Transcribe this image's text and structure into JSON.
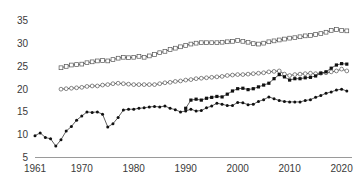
{
  "chart_data": {
    "type": "line",
    "title": "",
    "subtitle": "",
    "xlabel": "",
    "ylabel": "",
    "xlim": [
      1961,
      2022
    ],
    "ylim": [
      5,
      36.5
    ],
    "grid": false,
    "legend": "none",
    "x_ticks": [
      1961,
      1970,
      1980,
      1990,
      2000,
      2010,
      2020
    ],
    "x_tick_labels": [
      "1961",
      "1970",
      "1980",
      "1990",
      "2000",
      "2010",
      "2020"
    ],
    "y_ticks": [
      5,
      10,
      15,
      20,
      25,
      30,
      35
    ],
    "y_tick_labels": [
      "5",
      "10",
      "15",
      "20",
      "25",
      "30",
      "35"
    ],
    "series": [
      {
        "name": "series-open-squares",
        "marker": "open-square",
        "x": [
          1966,
          1967,
          1968,
          1969,
          1970,
          1971,
          1972,
          1973,
          1974,
          1975,
          1976,
          1977,
          1978,
          1979,
          1980,
          1981,
          1982,
          1983,
          1984,
          1985,
          1986,
          1987,
          1988,
          1989,
          1990,
          1991,
          1992,
          1993,
          1994,
          1995,
          1996,
          1997,
          1998,
          1999,
          2000,
          2001,
          2002,
          2003,
          2004,
          2005,
          2006,
          2007,
          2008,
          2009,
          2010,
          2011,
          2012,
          2013,
          2014,
          2015,
          2016,
          2017,
          2018,
          2019,
          2020,
          2021
        ],
        "values": [
          24.7,
          25.0,
          25.3,
          25.4,
          25.5,
          25.8,
          26.0,
          26.2,
          26.3,
          26.2,
          26.5,
          26.8,
          27.0,
          26.9,
          27.0,
          27.2,
          27.0,
          27.3,
          27.6,
          28.0,
          28.3,
          28.7,
          29.0,
          29.3,
          29.6,
          29.9,
          30.1,
          30.2,
          30.2,
          30.2,
          30.2,
          30.3,
          30.4,
          30.5,
          30.7,
          30.5,
          30.3,
          30.0,
          29.9,
          30.1,
          30.4,
          30.6,
          30.8,
          31.0,
          31.2,
          31.3,
          31.5,
          31.7,
          31.8,
          32.0,
          32.2,
          32.5,
          32.9,
          33.1,
          32.9,
          32.8
        ]
      },
      {
        "name": "series-open-circles",
        "marker": "open-circle",
        "x": [
          1966,
          1967,
          1968,
          1969,
          1970,
          1971,
          1972,
          1973,
          1974,
          1975,
          1976,
          1977,
          1978,
          1979,
          1980,
          1981,
          1982,
          1983,
          1984,
          1985,
          1986,
          1987,
          1988,
          1989,
          1990,
          1991,
          1992,
          1993,
          1994,
          1995,
          1996,
          1997,
          1998,
          1999,
          2000,
          2001,
          2002,
          2003,
          2004,
          2005,
          2006,
          2007,
          2008,
          2009,
          2010,
          2011,
          2012,
          2013,
          2014,
          2015,
          2016,
          2017,
          2018,
          2019,
          2020,
          2021
        ],
        "values": [
          20.0,
          20.1,
          20.2,
          20.3,
          20.4,
          20.6,
          20.7,
          20.7,
          20.9,
          21.0,
          21.2,
          21.3,
          21.2,
          21.1,
          21.0,
          21.0,
          21.0,
          21.0,
          21.0,
          21.2,
          21.4,
          21.5,
          21.7,
          21.8,
          22.0,
          22.1,
          22.3,
          22.4,
          22.5,
          22.6,
          22.7,
          22.8,
          23.0,
          23.1,
          23.2,
          23.2,
          23.3,
          23.4,
          23.5,
          23.6,
          23.8,
          23.9,
          24.0,
          23.3,
          23.0,
          23.2,
          23.3,
          23.4,
          23.5,
          23.4,
          23.5,
          23.6,
          23.8,
          24.0,
          24.4,
          24.0
        ]
      },
      {
        "name": "series-filled-squares",
        "marker": "filled-square",
        "x": [
          1990,
          1991,
          1992,
          1993,
          1994,
          1995,
          1996,
          1997,
          1998,
          1999,
          2000,
          2001,
          2002,
          2003,
          2004,
          2005,
          2006,
          2007,
          2008,
          2009,
          2010,
          2011,
          2012,
          2013,
          2014,
          2015,
          2016,
          2017,
          2018,
          2019,
          2020,
          2021
        ],
        "values": [
          15.8,
          17.6,
          17.8,
          17.6,
          18.0,
          18.2,
          18.4,
          18.3,
          18.9,
          19.6,
          20.1,
          20.2,
          19.9,
          20.1,
          20.5,
          20.9,
          21.3,
          22.3,
          23.2,
          22.7,
          22.0,
          22.3,
          22.3,
          22.5,
          22.6,
          22.9,
          23.5,
          23.8,
          24.6,
          25.3,
          25.6,
          25.5
        ]
      },
      {
        "name": "series-filled-circles",
        "marker": "filled-circle",
        "x": [
          1961,
          1962,
          1963,
          1964,
          1965,
          1966,
          1967,
          1968,
          1969,
          1970,
          1971,
          1972,
          1973,
          1974,
          1975,
          1976,
          1977,
          1978,
          1979,
          1980,
          1981,
          1982,
          1983,
          1984,
          1985,
          1986,
          1987,
          1988,
          1989,
          1990,
          1991,
          1992,
          1993,
          1994,
          1995,
          1996,
          1997,
          1998,
          1999,
          2000,
          2001,
          2002,
          2003,
          2004,
          2005,
          2006,
          2007,
          2008,
          2009,
          2010,
          2011,
          2012,
          2013,
          2014,
          2015,
          2016,
          2017,
          2018,
          2019,
          2020,
          2021
        ],
        "values": [
          9.8,
          10.4,
          9.4,
          9.1,
          7.5,
          8.9,
          10.8,
          11.8,
          13.2,
          14.1,
          15.0,
          14.9,
          15.0,
          14.5,
          11.7,
          12.4,
          13.8,
          15.4,
          15.6,
          15.6,
          15.8,
          15.9,
          16.1,
          16.2,
          16.1,
          16.3,
          15.8,
          15.5,
          15.0,
          15.2,
          15.6,
          15.2,
          15.3,
          15.9,
          16.3,
          16.9,
          16.7,
          16.4,
          16.4,
          17.1,
          17.0,
          16.6,
          16.7,
          17.3,
          17.7,
          18.3,
          17.9,
          17.5,
          17.3,
          17.2,
          17.2,
          17.2,
          17.5,
          17.7,
          18.2,
          18.6,
          19.1,
          19.4,
          19.8,
          20.0,
          19.6
        ]
      }
    ]
  }
}
